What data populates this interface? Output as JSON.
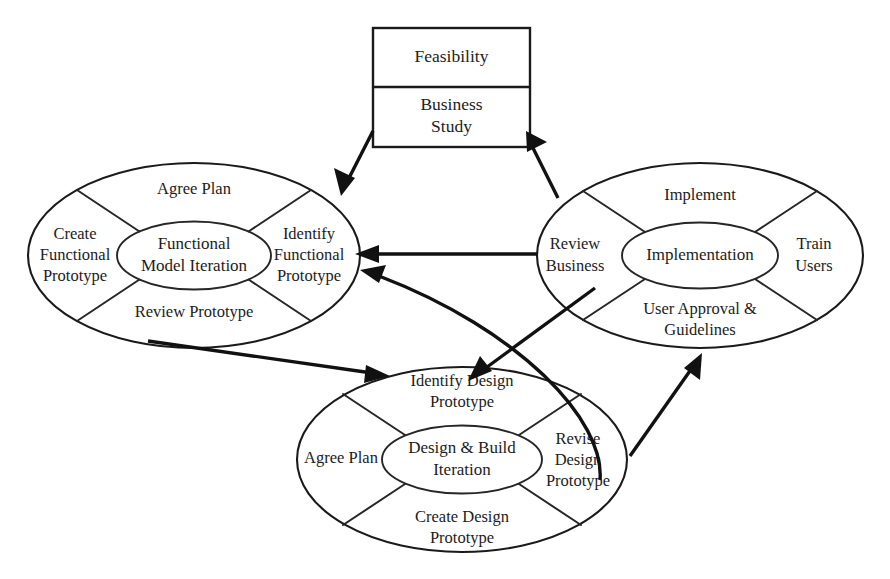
{
  "diagram": {
    "stage_box": {
      "name": "stage-box",
      "rows": [
        {
          "label": "Feasibility"
        },
        {
          "label_line1": "Business",
          "label_line2": "Study"
        }
      ]
    },
    "cycles": [
      {
        "id": "functional-model-iteration",
        "center_line1": "Functional",
        "center_line2": "Model Iteration",
        "segments": {
          "top": {
            "line1": "Agree Plan",
            "line2": ""
          },
          "right": {
            "line1": "Identify",
            "line2": "Functional",
            "line3": "Prototype"
          },
          "bottom": {
            "line1": "Review Prototype",
            "line2": ""
          },
          "left": {
            "line1": "Create",
            "line2": "Functional",
            "line3": "Prototype"
          }
        }
      },
      {
        "id": "implementation",
        "center_line1": "Implementation",
        "center_line2": "",
        "segments": {
          "top": {
            "line1": "Implement",
            "line2": ""
          },
          "right": {
            "line1": "Train",
            "line2": "Users",
            "line3": ""
          },
          "bottom": {
            "line1": "User Approval &",
            "line2": "Guidelines"
          },
          "left": {
            "line1": "Review",
            "line2": "Business",
            "line3": ""
          }
        }
      },
      {
        "id": "design-and-build-iteration",
        "center_line1": "Design & Build",
        "center_line2": "Iteration",
        "segments": {
          "top": {
            "line1": "Identify Design",
            "line2": "Prototype"
          },
          "right": {
            "line1": "Revise",
            "line2": "Design",
            "line3": "Prototype"
          },
          "bottom": {
            "line1": "Create Design",
            "line2": "Prototype"
          },
          "left": {
            "line1": "Agree Plan",
            "line2": "",
            "line3": ""
          }
        }
      }
    ],
    "colors": {
      "stroke": "#1a1a1a",
      "arrow": "#111111",
      "text": "#1c1c1c",
      "background": "#ffffff"
    }
  }
}
